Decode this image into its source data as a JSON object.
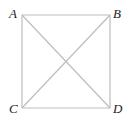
{
  "diagram": {
    "type": "square-with-diagonals",
    "line_color": "#bdbdbd",
    "label_color": "#222222",
    "vertices": [
      {
        "label": "A",
        "x": 22,
        "y": 15
      },
      {
        "label": "B",
        "x": 110,
        "y": 15
      },
      {
        "label": "C",
        "x": 22,
        "y": 108
      },
      {
        "label": "D",
        "x": 110,
        "y": 108
      }
    ],
    "edges": [
      [
        "A",
        "B"
      ],
      [
        "B",
        "D"
      ],
      [
        "D",
        "C"
      ],
      [
        "C",
        "A"
      ]
    ],
    "diagonals": [
      [
        "A",
        "D"
      ],
      [
        "B",
        "C"
      ]
    ]
  }
}
